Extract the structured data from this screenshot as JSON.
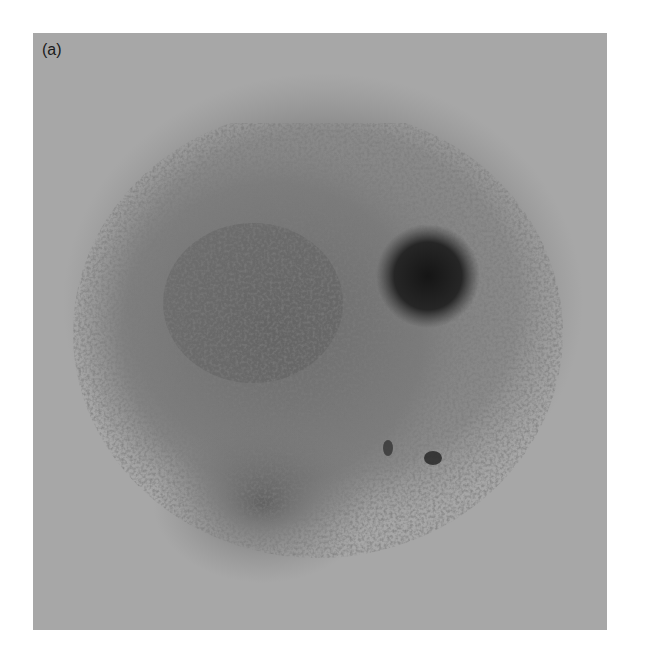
{
  "figure": {
    "panel_label": "(a)",
    "colors": {
      "background": "#a7a7a7",
      "speckle": "#5a5a5a",
      "dense_spot": "#1e1e1e"
    }
  }
}
